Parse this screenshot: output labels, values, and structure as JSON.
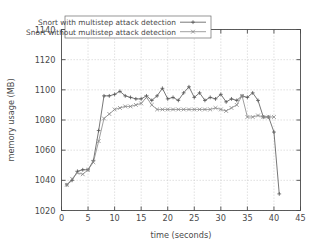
{
  "chart_data": {
    "type": "line",
    "title": "",
    "xlabel": "time (seconds)",
    "ylabel": "memory usage (MB)",
    "xlim": [
      0,
      45
    ],
    "ylim": [
      1020,
      1140
    ],
    "xticks": [
      0,
      5,
      10,
      15,
      20,
      25,
      30,
      35,
      40,
      45
    ],
    "yticks": [
      1020,
      1040,
      1060,
      1080,
      1100,
      1120,
      1140
    ],
    "grid": true,
    "legend_position": "top-left-inside",
    "series": [
      {
        "name": "Snort with multistep attack detection",
        "color": "#555555",
        "marker": "plus",
        "x": [
          1,
          2,
          3,
          4,
          5,
          6,
          7,
          8,
          9,
          10,
          11,
          12,
          13,
          14,
          15,
          16,
          17,
          18,
          19,
          20,
          21,
          22,
          23,
          24,
          25,
          26,
          27,
          28,
          29,
          30,
          31,
          32,
          33,
          34,
          35,
          36,
          37,
          38,
          39,
          40,
          41
        ],
        "values": [
          1037,
          1040,
          1046,
          1047,
          1047,
          1053,
          1073,
          1096,
          1096,
          1097,
          1099,
          1096,
          1095,
          1094,
          1094,
          1096,
          1093,
          1096,
          1101,
          1094,
          1095,
          1093,
          1098,
          1102,
          1095,
          1098,
          1093,
          1095,
          1094,
          1097,
          1092,
          1094,
          1093,
          1096,
          1095,
          1098,
          1093,
          1082,
          1082,
          1072,
          1031
        ]
      },
      {
        "name": "Snort without multistep attack detection",
        "color": "#888888",
        "marker": "cross",
        "x": [
          1,
          2,
          3,
          4,
          5,
          6,
          7,
          8,
          9,
          10,
          11,
          12,
          13,
          14,
          15,
          16,
          17,
          18,
          19,
          20,
          21,
          22,
          23,
          24,
          25,
          26,
          27,
          28,
          29,
          30,
          31,
          32,
          33,
          34,
          35,
          36,
          37,
          38,
          39,
          40
        ],
        "values": [
          1037,
          1041,
          1045,
          1044,
          1047,
          1052,
          1066,
          1081,
          1084,
          1087,
          1088,
          1089,
          1089,
          1090,
          1091,
          1095,
          1090,
          1087,
          1087,
          1087,
          1087,
          1087,
          1087,
          1087,
          1087,
          1087,
          1087,
          1087,
          1088,
          1087,
          1086,
          1088,
          1090,
          1096,
          1082,
          1082,
          1083,
          1082,
          1082,
          1082
        ]
      }
    ]
  },
  "legend": {
    "entries": [
      {
        "label": "Snort with multistep attack detection"
      },
      {
        "label": "Snort without multistep attack detection"
      }
    ]
  },
  "axes": {
    "x_tick_labels": [
      "0",
      "5",
      "10",
      "15",
      "20",
      "25",
      "30",
      "35",
      "40",
      "45"
    ],
    "y_tick_labels": [
      "1020",
      "1040",
      "1060",
      "1080",
      "1100",
      "1120",
      "1140"
    ],
    "x_title": "time (seconds)",
    "y_title": "memory usage (MB)"
  },
  "colors": {
    "border": "#4a4a4a",
    "grid": "#c8c8c8",
    "series1": "#555555",
    "series2": "#8e8e8e",
    "background": "#ffffff"
  }
}
